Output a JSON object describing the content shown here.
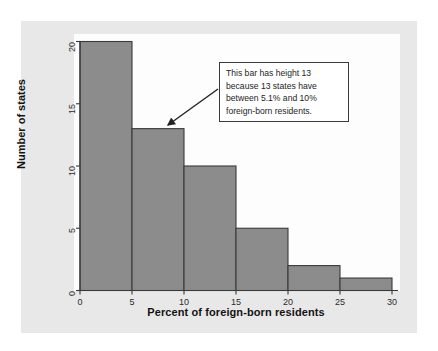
{
  "chart_data": {
    "type": "bar",
    "title": "",
    "subtitle": "",
    "xlabel": "Percent of foreign-born residents",
    "ylabel": "Number of states",
    "categories": [
      "0-5",
      "5-10",
      "10-15",
      "15-20",
      "20-25",
      "25-30"
    ],
    "bin_edges": [
      0,
      5,
      10,
      15,
      20,
      25,
      30
    ],
    "values": [
      20,
      13,
      10,
      5,
      2,
      1
    ],
    "xlim": [
      0,
      30
    ],
    "ylim": [
      0,
      20
    ],
    "xticks": [
      "0",
      "5",
      "10",
      "15",
      "20",
      "25",
      "30"
    ],
    "yticks": [
      "0",
      "5",
      "10",
      "15",
      "20"
    ],
    "grid": false,
    "legend": null,
    "bar_color": "#8c8c8c",
    "bar_edge_color": "#3a3a3a",
    "plot_background": "#fdfdfd",
    "figure_background": "#e8e8e8",
    "annotations": [
      {
        "name": "bar-height-callout",
        "lines": [
          "This bar has height 13",
          "because 13 states have",
          "between 5.1% and 10%",
          "foreign-born residents."
        ],
        "points_to_category": "5-10",
        "points_to_value": 13
      }
    ]
  }
}
